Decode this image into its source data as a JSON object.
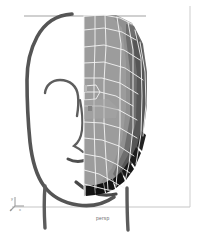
{
  "viewport": {
    "label": "persp",
    "background_color": "#ffffff",
    "border_color": "#c9c9c9"
  },
  "axis_gizmo": {
    "name": "axis-gizmo",
    "y_label": "y",
    "z_label": "z",
    "x_label": "x",
    "color": "#9a9a9a"
  },
  "reference_image": {
    "name": "head-profile-sketch",
    "stroke_color": "#5a5a5a",
    "guide_line_color": "#b5b5b5"
  },
  "mesh": {
    "name": "half-face-polygon-mesh",
    "wireframe_color": "#f2f2f2",
    "face_light": "#9d9d9d",
    "face_mid": "#8a8a8a",
    "face_dark": "#6a6a6a",
    "face_darker": "#4e4e4e",
    "face_black": "#151515"
  }
}
